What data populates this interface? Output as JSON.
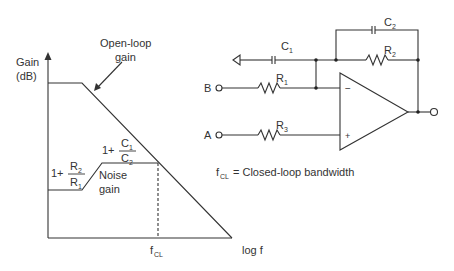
{
  "graph": {
    "y_axis_label_line1": "Gain",
    "y_axis_label_line2": "(dB)",
    "x_axis_label": "log f",
    "open_loop_label_line1": "Open-loop",
    "open_loop_label_line2": "gain",
    "noise_gain_label_line1": "Noise",
    "noise_gain_label_line2": "gain",
    "low_gain_expr": {
      "prefix": "1+",
      "num": "R",
      "num_sub": "2",
      "den": "R",
      "den_sub": "1"
    },
    "high_gain_expr": {
      "prefix": "1+",
      "num": "C",
      "num_sub": "1",
      "den": "C",
      "den_sub": "2"
    },
    "fcl_tick": {
      "main": "f",
      "sub": "CL"
    }
  },
  "circuit": {
    "C1": {
      "main": "C",
      "sub": "1"
    },
    "C2": {
      "main": "C",
      "sub": "2"
    },
    "R1": {
      "main": "R",
      "sub": "1"
    },
    "R2": {
      "main": "R",
      "sub": "2"
    },
    "R3": {
      "main": "R",
      "sub": "3"
    },
    "input_B": "B",
    "input_A": "A",
    "minus": "−",
    "plus": "+"
  },
  "legend": {
    "symbol_main": "f",
    "symbol_sub": "CL",
    "text": "= Closed-loop bandwidth"
  }
}
